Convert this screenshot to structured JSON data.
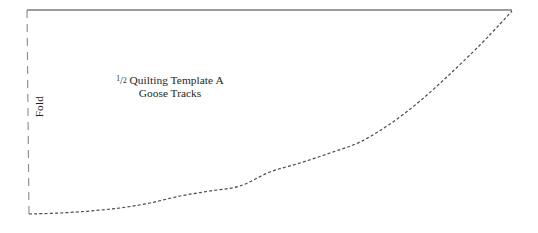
{
  "figure": {
    "kind": "quilting-template-pattern-diagram",
    "background_color": "#ffffff",
    "width": 538,
    "height": 233
  },
  "labels": {
    "fold": "Fold",
    "template_numerator": "1",
    "template_slash": "/",
    "template_denominator": "2",
    "template_title": " Quilting Template A",
    "template_subtitle": "Goose Tracks"
  },
  "lines": {
    "top_edge": {
      "name": "top-edge",
      "style": "solid",
      "color": "#3a3a3a",
      "width": 1.1,
      "from": [
        27,
        10
      ],
      "to": [
        512,
        10
      ]
    },
    "fold_edge": {
      "name": "fold-edge",
      "style": "dashed",
      "color": "#8a8a8a",
      "width": 1.1,
      "dash": "8 6",
      "from": [
        27,
        10
      ],
      "to": [
        29,
        215
      ]
    },
    "template_curve": {
      "name": "template-curve",
      "style": "dotted",
      "color": "#4a4a60",
      "width": 1.2,
      "dash": "3 2.2",
      "from": [
        29,
        214
      ],
      "to": [
        512,
        11
      ],
      "points": [
        [
          29,
          214
        ],
        [
          60,
          213
        ],
        [
          90,
          211
        ],
        [
          120,
          208
        ],
        [
          150,
          203
        ],
        [
          180,
          196
        ],
        [
          210,
          191
        ],
        [
          240,
          186
        ],
        [
          270,
          172
        ],
        [
          300,
          163
        ],
        [
          330,
          153
        ],
        [
          360,
          142
        ],
        [
          390,
          124
        ],
        [
          420,
          101
        ],
        [
          450,
          74
        ],
        [
          480,
          45
        ],
        [
          500,
          24
        ],
        [
          512,
          11
        ]
      ]
    }
  },
  "colors": {
    "ink": "#241f1f",
    "solid_line": "#3a3a3a",
    "dashed_line": "#8a8a8a",
    "dotted_curve": "#4a4a60",
    "paper": "#ffffff"
  }
}
